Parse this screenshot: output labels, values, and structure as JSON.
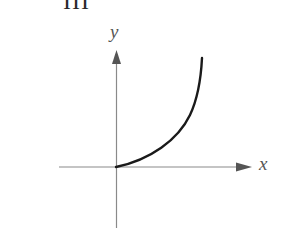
{
  "figure": {
    "panel_label": "III",
    "x_axis_label": "x",
    "y_axis_label": "y",
    "colors": {
      "axis": "#8a8a8a",
      "arrow": "#555555",
      "curve": "#1a1a1a",
      "text": "#555555"
    },
    "curve_description": "increasing concave-up curve starting at the origin"
  }
}
